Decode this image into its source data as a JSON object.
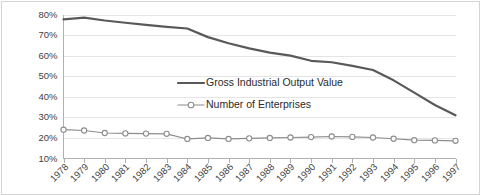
{
  "chart_data": {
    "type": "line",
    "title": "",
    "subtitle": "",
    "xlabel": "",
    "ylabel": "",
    "grid": true,
    "legend_position": "center",
    "categories": [
      "1978",
      "1979",
      "1980",
      "1981",
      "1982",
      "1983",
      "1984",
      "1985",
      "1986",
      "1987",
      "1988",
      "1989",
      "1990",
      "1991",
      "1992",
      "1993",
      "1994",
      "1995",
      "1996",
      "1997"
    ],
    "ylim": [
      10,
      80
    ],
    "ytick_labels": [
      "80%",
      "70%",
      "60%",
      "50%",
      "40%",
      "30%",
      "20%",
      "10%"
    ],
    "ytick_values": [
      80,
      70,
      60,
      50,
      40,
      30,
      20,
      10
    ],
    "series": [
      {
        "name": "Gross Industrial Output Value",
        "marker": "none",
        "color": "#595959",
        "values": [
          77.6,
          78.5,
          77.1,
          76.0,
          75.0,
          74.0,
          73.2,
          69.0,
          66.0,
          63.5,
          61.5,
          60.0,
          57.5,
          56.8,
          55.0,
          53.0,
          48.0,
          42.0,
          36.0,
          31.0
        ]
      },
      {
        "name": "Number of Enterprises",
        "marker": "open-circle",
        "color": "#8c8c8c",
        "values": [
          24.0,
          23.6,
          22.4,
          22.2,
          22.1,
          22.0,
          19.5,
          20.0,
          19.5,
          19.8,
          20.0,
          20.2,
          20.4,
          20.7,
          20.5,
          20.2,
          19.6,
          18.9,
          18.8,
          18.6
        ]
      }
    ],
    "legend": [
      {
        "label": "Gross Industrial Output Value",
        "marker": "line",
        "color": "#595959"
      },
      {
        "label": "Number of Enterprises",
        "marker": "line-open-circle",
        "color": "#8c8c8c"
      }
    ]
  }
}
